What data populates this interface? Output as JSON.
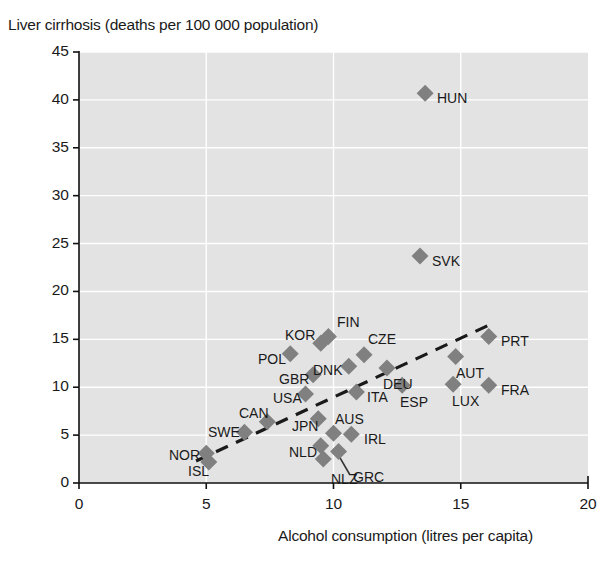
{
  "chart_data": {
    "type": "scatter",
    "title": "",
    "ylabel": "Liver cirrhosis (deaths per 100 000 population)",
    "xlabel": "Alcohol consumption (litres per capita)",
    "xlim": [
      0,
      20
    ],
    "ylim": [
      0,
      45
    ],
    "xticks": [
      "0",
      "5",
      "10",
      "15",
      "20"
    ],
    "xtick_values": [
      0,
      5,
      10,
      15,
      20
    ],
    "yticks": [
      "0",
      "5",
      "10",
      "15",
      "20",
      "25",
      "30",
      "35",
      "40",
      "45"
    ],
    "ytick_values": [
      0,
      5,
      10,
      15,
      20,
      25,
      30,
      35,
      40,
      45
    ],
    "grid": true,
    "legend": "none",
    "annotation": "R² = 0.24",
    "r_squared": 0.24,
    "marker_color": "#808080",
    "plot_background": "#e3e3e3",
    "trendline": {
      "style": "dashed",
      "color": "#1a1a1a",
      "x": [
        4.6,
        16.2
      ],
      "y": [
        2.3,
        16.6
      ]
    },
    "points": [
      {
        "code": "HUN",
        "x": 13.6,
        "y": 40.7,
        "label_dx": 12,
        "label_dy": 5
      },
      {
        "code": "SVK",
        "x": 13.4,
        "y": 23.7,
        "label_dx": 12,
        "label_dy": 5
      },
      {
        "code": "PRT",
        "x": 16.1,
        "y": 15.3,
        "label_dx": 12,
        "label_dy": 5
      },
      {
        "code": "FIN",
        "x": 9.8,
        "y": 15.3,
        "label_dx": -6,
        "label_dy": -14
      },
      {
        "code": "KOR",
        "x": 9.5,
        "y": 14.6,
        "label_dx": -44,
        "label_dy": -8
      },
      {
        "code": "CZE",
        "x": 11.2,
        "y": 13.4,
        "label_dx": -6,
        "label_dy": -16
      },
      {
        "code": "POL",
        "x": 8.3,
        "y": 13.5,
        "label_dx": -42,
        "label_dy": 5
      },
      {
        "code": "AUT",
        "x": 14.8,
        "y": 13.2,
        "label_dx": -10,
        "label_dy": 16
      },
      {
        "code": "DNK",
        "x": 10.6,
        "y": 12.2,
        "label_dx": -44,
        "label_dy": 4
      },
      {
        "code": "DEU",
        "x": 12.1,
        "y": 12.0,
        "label_dx": -12,
        "label_dy": 16
      },
      {
        "code": "GBR",
        "x": 9.2,
        "y": 11.3,
        "label_dx": -42,
        "label_dy": 4
      },
      {
        "code": "FRA",
        "x": 16.1,
        "y": 10.2,
        "label_dx": 12,
        "label_dy": 5
      },
      {
        "code": "LUX",
        "x": 14.7,
        "y": 10.3,
        "label_dx": -12,
        "label_dy": 17
      },
      {
        "code": "ESP",
        "x": 12.7,
        "y": 10.2,
        "label_dx": -12,
        "label_dy": 17
      },
      {
        "code": "ITA",
        "x": 10.9,
        "y": 9.5,
        "label_dx": 11,
        "label_dy": 5
      },
      {
        "code": "USA",
        "x": 8.9,
        "y": 9.3,
        "label_dx": -42,
        "label_dy": 4
      },
      {
        "code": "JPN",
        "x": 9.4,
        "y": 6.7,
        "label_dx": -38,
        "label_dy": 7
      },
      {
        "code": "CAN",
        "x": 7.4,
        "y": 6.4,
        "label_dx": -36,
        "label_dy": -9
      },
      {
        "code": "SWE",
        "x": 6.5,
        "y": 5.3,
        "label_dx": -42,
        "label_dy": 0
      },
      {
        "code": "AUS",
        "x": 10.0,
        "y": 5.2,
        "label_dx": -8,
        "label_dy": -14
      },
      {
        "code": "IRL",
        "x": 10.7,
        "y": 5.1,
        "label_dx": 13,
        "label_dy": 5
      },
      {
        "code": "NLD",
        "x": 9.5,
        "y": 3.9,
        "label_dx": -42,
        "label_dy": 6
      },
      {
        "code": "GRC",
        "x": 10.2,
        "y": 3.3,
        "label_dx": 14,
        "label_dy": 26,
        "leader": true
      },
      {
        "code": "NLZ",
        "x": 9.6,
        "y": 2.5,
        "label_dx": -4,
        "label_dy": 20
      },
      {
        "code": "NOR",
        "x": 5.0,
        "y": 3.1,
        "label_dx": -44,
        "label_dy": 2
      },
      {
        "code": "ISL",
        "x": 5.1,
        "y": 2.2,
        "label_dx": -38,
        "label_dy": 9
      }
    ]
  }
}
